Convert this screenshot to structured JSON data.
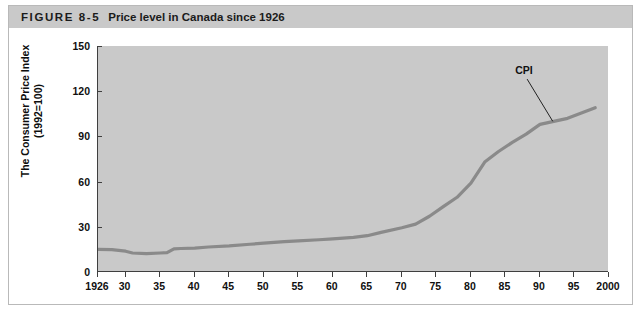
{
  "header": {
    "figure_number": "FIGURE 8-5",
    "title": "Price level in Canada since 1926"
  },
  "colors": {
    "banner": "#c9c9c9",
    "plot_background": "#c9c9c9",
    "axis": "#3f3f3f",
    "line": "#8a8a8a",
    "text": "#111111"
  },
  "chart_data": {
    "type": "line",
    "title": "Price level in Canada since 1926",
    "xlabel": "",
    "ylabel": "The Consumer Price Index (1992=100)",
    "ylabel_line1": "The Consumer Price Index",
    "ylabel_line2": "(1992=100)",
    "xlim": [
      1926,
      2000
    ],
    "ylim": [
      0,
      150
    ],
    "grid": false,
    "legend_position": "none",
    "y_ticks": [
      0,
      30,
      60,
      90,
      120,
      150
    ],
    "y_tick_labels": [
      "0",
      "30",
      "60",
      "90",
      "120",
      "150"
    ],
    "x_ticks": [
      1926,
      1930,
      1935,
      1940,
      1945,
      1950,
      1955,
      1960,
      1965,
      1970,
      1975,
      1980,
      1985,
      1990,
      1995,
      2000
    ],
    "x_tick_labels": [
      "1926",
      "30",
      "35",
      "40",
      "45",
      "50",
      "55",
      "60",
      "65",
      "70",
      "75",
      "80",
      "85",
      "90",
      "95",
      "2000"
    ],
    "annotations": [
      {
        "text": "CPI",
        "x": 1992,
        "y": 100,
        "label_x": 1988,
        "label_y": 134
      }
    ],
    "series": [
      {
        "name": "CPI",
        "x": [
          1926,
          1928,
          1930,
          1931,
          1933,
          1935,
          1936,
          1937,
          1938,
          1940,
          1942,
          1945,
          1948,
          1950,
          1953,
          1955,
          1958,
          1960,
          1963,
          1965,
          1967,
          1970,
          1972,
          1974,
          1976,
          1978,
          1980,
          1981,
          1982,
          1984,
          1986,
          1988,
          1990,
          1992,
          1994,
          1996,
          1998
        ],
        "y": [
          15.0,
          14.8,
          13.8,
          12.6,
          12.2,
          12.6,
          12.8,
          15.4,
          15.6,
          15.9,
          16.6,
          17.3,
          18.4,
          19.1,
          20.1,
          20.6,
          21.4,
          22.0,
          23.0,
          24.1,
          26.3,
          29.4,
          31.8,
          37.0,
          43.4,
          49.6,
          59.0,
          66.0,
          73.0,
          80.0,
          86.0,
          91.5,
          98.0,
          100.0,
          102.0,
          105.5,
          109.0
        ]
      }
    ]
  }
}
